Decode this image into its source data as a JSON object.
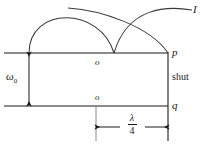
{
  "figure": {
    "name": "waveguide-shutter-diagram",
    "stroke_color": "#1a1a1a",
    "background_color": "#ffffff",
    "labels": {
      "intensity": "I",
      "port_p": "p",
      "port_q": "q",
      "shutter": "shut",
      "origin_top": "o",
      "origin_bottom": "o",
      "beam_waist": "ω",
      "beam_waist_subscript": "0",
      "dimension_numerator": "λ",
      "dimension_denominator": "4"
    },
    "geometry": {
      "top_line": {
        "x1": 4,
        "y1": 53,
        "x2": 168,
        "y2": 53
      },
      "bottom_line": {
        "x1": 4,
        "y1": 106,
        "x2": 168,
        "y2": 106
      },
      "shutter_line": {
        "x1": 168,
        "y1": 53,
        "x2": 168,
        "y2": 141
      },
      "waist_arrow": {
        "x": 29,
        "y1": 53,
        "y2": 106
      },
      "dimension_extension_left": {
        "x": 96,
        "y1": 106,
        "y2": 141
      },
      "dimension_arrow": {
        "y": 127,
        "x1": 99,
        "x2": 165
      },
      "arc_left": {
        "start_x": 29,
        "start_y": 53,
        "peak_y": 13,
        "end_x": 114,
        "end_y": 53
      },
      "arc_right": {
        "start_x": 114,
        "start_y": 53,
        "peak_y": 13,
        "end_x": 168,
        "end_y": 53
      },
      "arc_tail_x": 192
    }
  }
}
